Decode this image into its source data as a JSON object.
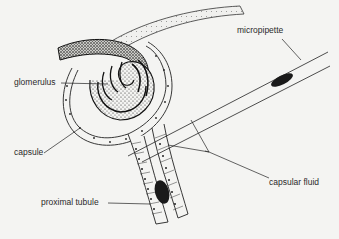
{
  "diagram": {
    "type": "anatomical-illustration",
    "colors": {
      "background": "#f4f4f2",
      "ink": "#1a1a1a",
      "label": "#2a2a2a"
    },
    "labels": {
      "glomerulus": "glomerulus",
      "capsule": "capsule",
      "proximal_tubule": "proximal tubule",
      "micropipette": "micropipette",
      "capsular_fluid": "capsular fluid"
    }
  }
}
